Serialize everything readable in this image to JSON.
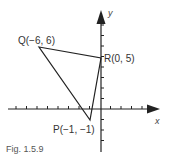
{
  "figure": {
    "caption": "Fig. 1.5.9",
    "axes": {
      "x_label": "x",
      "y_label": "y"
    },
    "points": [
      {
        "name": "Q",
        "label": "Q(−6, 6)",
        "x": -6,
        "y": 6
      },
      {
        "name": "R",
        "label": "R(0, 5)",
        "x": 0,
        "y": 5
      },
      {
        "name": "P",
        "label": "P(−1, −1)",
        "x": -1,
        "y": -1
      }
    ],
    "colors": {
      "line": "#222222",
      "text": "#333333"
    }
  }
}
